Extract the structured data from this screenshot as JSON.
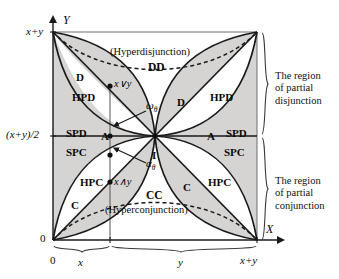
{
  "figure": {
    "axes": {
      "x_axis_label": "X",
      "y_axis_label": "Y",
      "origin_label": "0",
      "origin_label_x": "0",
      "y_top_label": "x+y",
      "y_mid_label": "(x+y)/2",
      "x_end_label": "x+y"
    },
    "brace_labels": {
      "x_segment": "x",
      "y_segment": "y"
    },
    "region_notes": {
      "top": "The region\nof partial\ndisjunction",
      "bottom": "The region\nof partial\nconjunction"
    },
    "curve_captions": {
      "hyperdisjunction_paren": "(Hyperdisjunction)",
      "hyperdisjunction_code": "DD",
      "hyperconjunction_code": "CC",
      "hyperconjunction_paren": "(Hyperconjunction)"
    },
    "point_labels": {
      "join": "x∨y",
      "meet": "x∧y",
      "omega": "ω",
      "omega_sub": "θ",
      "alpha": "α",
      "alpha_sub": "θ",
      "center": "I"
    },
    "zone_labels": [
      {
        "name": "D-left",
        "text": "D",
        "x": 76,
        "y": 72
      },
      {
        "name": "HPD-left",
        "text": "HPD",
        "x": 72,
        "y": 92
      },
      {
        "name": "SPD-left",
        "text": "SPD",
        "x": 66,
        "y": 128
      },
      {
        "name": "A-left",
        "text": "A",
        "x": 101,
        "y": 131
      },
      {
        "name": "SPC-left",
        "text": "SPC",
        "x": 66,
        "y": 147
      },
      {
        "name": "HPC-left",
        "text": "HPC",
        "x": 80,
        "y": 177
      },
      {
        "name": "C-left",
        "text": "C",
        "x": 71,
        "y": 200
      },
      {
        "name": "D-right",
        "text": "D",
        "x": 177,
        "y": 97
      },
      {
        "name": "HPD-right",
        "text": "HPD",
        "x": 210,
        "y": 92
      },
      {
        "name": "A-right",
        "text": "A",
        "x": 207,
        "y": 131
      },
      {
        "name": "SPD-right",
        "text": "SPD",
        "x": 226,
        "y": 128
      },
      {
        "name": "SPC-right",
        "text": "SPC",
        "x": 224,
        "y": 147
      },
      {
        "name": "HPC-right",
        "text": "HPC",
        "x": 208,
        "y": 177
      },
      {
        "name": "C-right",
        "text": "C",
        "x": 183,
        "y": 182
      },
      {
        "name": "I-center",
        "text": "I",
        "x": 152,
        "y": 150
      }
    ],
    "colors": {
      "shaded_region": "#d6d4d2",
      "line": "#1a1a1a",
      "background": "#ffffff",
      "text": "#0d0d0d"
    },
    "geometry": {
      "left": 53,
      "right": 257,
      "top": 32,
      "bottom": 240,
      "mid_y": 136,
      "x_tick": 110
    }
  }
}
